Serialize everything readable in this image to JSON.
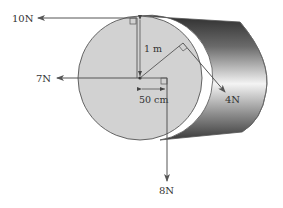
{
  "diagram": {
    "colors": {
      "face_fill": "#d2d2d2",
      "outline": "#555555",
      "arrow": "#555555",
      "body_dark": "#3a3a3a",
      "body_light": "#f2f2f2"
    },
    "forces": [
      {
        "id": "force-10n",
        "label": "10N",
        "magnitude_N": 10,
        "direction": "left",
        "applied_at": "top of end face, tangent"
      },
      {
        "id": "force-7n",
        "label": "7N",
        "magnitude_N": 7,
        "direction": "left",
        "applied_at": "center of end face"
      },
      {
        "id": "force-4n",
        "label": "4N",
        "magnitude_N": 4,
        "direction": "down-right",
        "applied_at": "rim of end face, tangent"
      },
      {
        "id": "force-8n",
        "label": "8N",
        "magnitude_N": 8,
        "direction": "down",
        "applied_at": "50 cm right of center"
      }
    ],
    "dimensions": {
      "radius_label": "1 m",
      "offset_label": "50 cm"
    }
  }
}
